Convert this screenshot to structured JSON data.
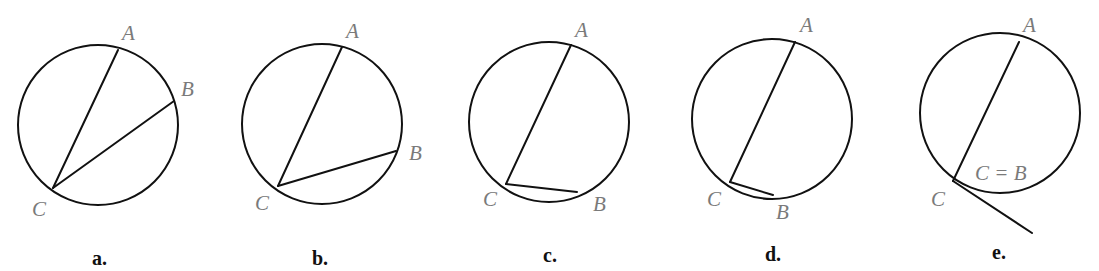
{
  "figures": [
    {
      "id": "a",
      "caption": "a.",
      "circle": {
        "cx": 98,
        "cy": 125,
        "r": 80
      },
      "points": {
        "A": [
          118,
          50
        ],
        "B": [
          174,
          101
        ],
        "C": [
          53,
          188
        ]
      },
      "labels": {
        "A": {
          "text": "A",
          "x": 122,
          "y": 40
        },
        "B": {
          "text": "B",
          "x": 181,
          "y": 96
        },
        "C": {
          "text": "C",
          "x": 32,
          "y": 216
        }
      },
      "caption_pos": [
        92,
        265
      ]
    },
    {
      "id": "b",
      "caption": "b.",
      "circle": {
        "cx": 322,
        "cy": 124,
        "r": 80
      },
      "points": {
        "A": [
          342,
          47
        ],
        "B": [
          396,
          151
        ],
        "C": [
          278,
          186
        ]
      },
      "labels": {
        "A": {
          "text": "A",
          "x": 346,
          "y": 38
        },
        "B": {
          "text": "B",
          "x": 409,
          "y": 160
        },
        "C": {
          "text": "C",
          "x": 255,
          "y": 210
        }
      },
      "caption_pos": [
        312,
        265
      ]
    },
    {
      "id": "c",
      "caption": "c.",
      "circle": {
        "cx": 549,
        "cy": 122,
        "r": 80
      },
      "points": {
        "A": [
          571,
          45
        ],
        "B": [
          577,
          192
        ],
        "C": [
          506,
          184
        ]
      },
      "labels": {
        "A": {
          "text": "A",
          "x": 575,
          "y": 37
        },
        "B": {
          "text": "B",
          "x": 593,
          "y": 211
        },
        "C": {
          "text": "C",
          "x": 483,
          "y": 206
        }
      },
      "caption_pos": [
        543,
        262
      ]
    },
    {
      "id": "d",
      "caption": "d.",
      "circle": {
        "cx": 772,
        "cy": 119,
        "r": 80
      },
      "points": {
        "A": [
          795,
          42
        ],
        "B": [
          773,
          195
        ],
        "C": [
          730,
          182
        ]
      },
      "labels": {
        "A": {
          "text": "A",
          "x": 800,
          "y": 32
        },
        "B": {
          "text": "B",
          "x": 776,
          "y": 219
        },
        "C": {
          "text": "C",
          "x": 707,
          "y": 206
        }
      },
      "caption_pos": [
        765,
        261
      ]
    },
    {
      "id": "e",
      "caption": "e.",
      "circle": {
        "cx": 1000,
        "cy": 113,
        "r": 80
      },
      "points": {
        "A": [
          1019,
          42
        ],
        "C": [
          953,
          181
        ]
      },
      "tangent_end": [
        1032,
        233
      ],
      "labels": {
        "A": {
          "text": "A",
          "x": 1023,
          "y": 32
        },
        "C": {
          "text": "C",
          "x": 931,
          "y": 206
        },
        "CB": {
          "text": "C = B",
          "x": 975,
          "y": 180
        }
      },
      "caption_pos": [
        992,
        259
      ]
    }
  ]
}
